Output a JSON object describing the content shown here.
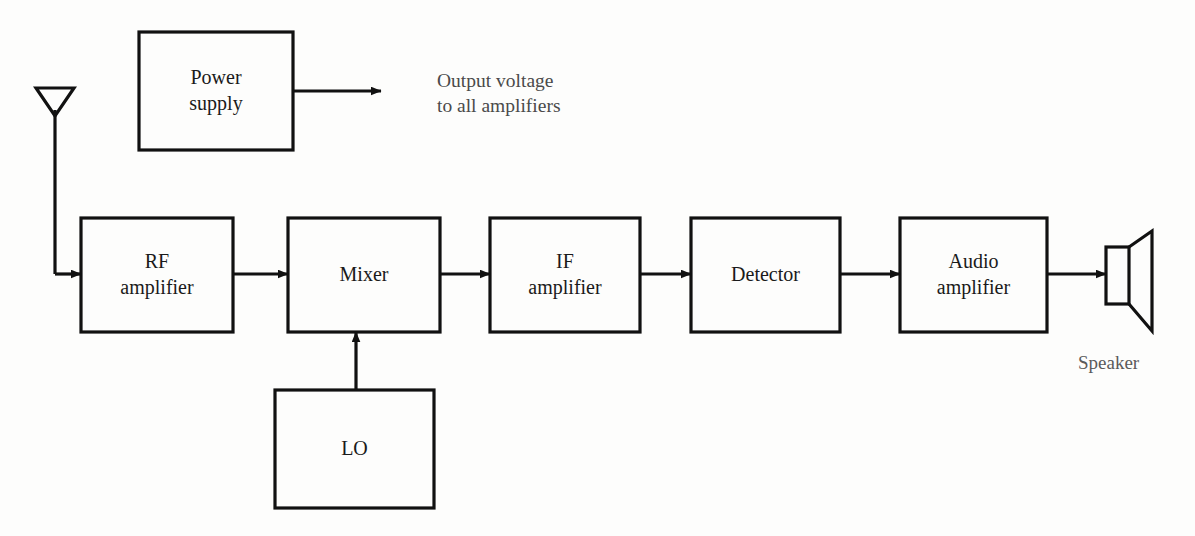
{
  "diagram": {
    "stroke_color": "#111111",
    "text_color": "#1a1a1a",
    "annotation_color": "#4a4a4a",
    "background_color": "#fdfdfc"
  },
  "blocks": [
    {
      "id": "power-supply",
      "lines": [
        "Power",
        "supply"
      ],
      "x": 139,
      "y": 32,
      "w": 154,
      "h": 118
    },
    {
      "id": "rf-amplifier",
      "lines": [
        "RF",
        "amplifier"
      ],
      "x": 81,
      "y": 218,
      "w": 152,
      "h": 114
    },
    {
      "id": "mixer",
      "lines": [
        "Mixer"
      ],
      "x": 288,
      "y": 218,
      "w": 152,
      "h": 114
    },
    {
      "id": "if-amplifier",
      "lines": [
        "IF",
        "amplifier"
      ],
      "x": 490,
      "y": 218,
      "w": 150,
      "h": 114
    },
    {
      "id": "detector",
      "lines": [
        "Detector"
      ],
      "x": 691,
      "y": 218,
      "w": 149,
      "h": 114
    },
    {
      "id": "audio-amplifier",
      "lines": [
        "Audio",
        "amplifier"
      ],
      "x": 900,
      "y": 218,
      "w": 147,
      "h": 114
    },
    {
      "id": "lo",
      "lines": [
        "LO"
      ],
      "x": 275,
      "y": 390,
      "w": 159,
      "h": 118
    }
  ],
  "annotations": {
    "power_output": {
      "lines": [
        "Output voltage",
        "to all amplifiers"
      ],
      "x": 437,
      "y": 68
    },
    "speaker": {
      "text": "Speaker",
      "x": 1078,
      "y": 352
    }
  },
  "icons": {
    "antenna": "antenna-icon",
    "speaker": "speaker-icon"
  },
  "connections": [
    {
      "id": "antenna-to-rf",
      "from": "antenna",
      "to": "rf-amplifier"
    },
    {
      "id": "power-supply-output",
      "from": "power-supply",
      "to": "power-output-annotation"
    },
    {
      "id": "rf-to-mixer",
      "from": "rf-amplifier",
      "to": "mixer"
    },
    {
      "id": "lo-to-mixer",
      "from": "lo",
      "to": "mixer"
    },
    {
      "id": "mixer-to-if",
      "from": "mixer",
      "to": "if-amplifier"
    },
    {
      "id": "if-to-detector",
      "from": "if-amplifier",
      "to": "detector"
    },
    {
      "id": "detector-to-audio",
      "from": "detector",
      "to": "audio-amplifier"
    },
    {
      "id": "audio-to-speaker",
      "from": "audio-amplifier",
      "to": "speaker"
    }
  ]
}
